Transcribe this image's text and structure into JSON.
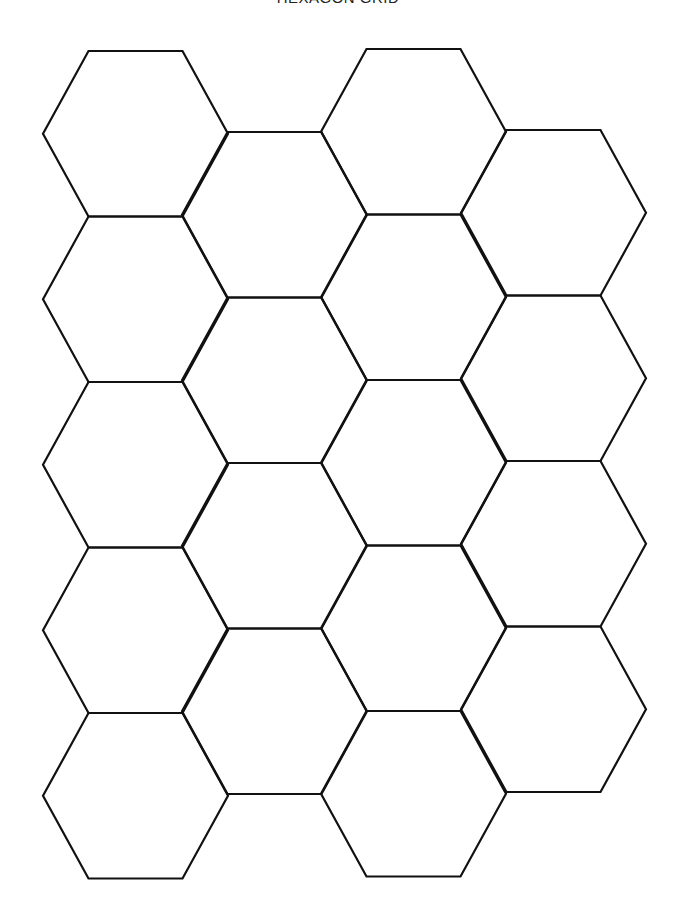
{
  "title": "HEXAGON GRID",
  "grid": {
    "stroke_color": "#111111",
    "background": "#ffffff",
    "hex_width": 185,
    "hex_top_edge": 94,
    "hex_height": 165.5,
    "columns": [
      {
        "left_x": 43,
        "top_y": 51,
        "count": 5
      },
      {
        "left_x": 182,
        "top_y": 132,
        "count": 4
      },
      {
        "left_x": 321,
        "top_y": 49,
        "count": 5
      },
      {
        "left_x": 461,
        "top_y": 130,
        "count": 4
      }
    ],
    "total_hexagons": 18
  }
}
